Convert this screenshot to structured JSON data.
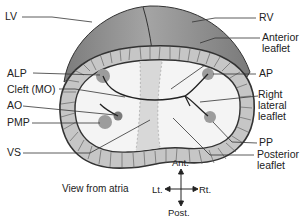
{
  "figure": {
    "caption": "View from atria",
    "labels_left": [
      {
        "id": "lv",
        "text": "LV"
      },
      {
        "id": "alp",
        "text": "ALP"
      },
      {
        "id": "cleft",
        "text": "Cleft (MO)"
      },
      {
        "id": "ao",
        "text": "AO"
      },
      {
        "id": "pmp",
        "text": "PMP"
      },
      {
        "id": "vs",
        "text": "VS"
      }
    ],
    "labels_right": [
      {
        "id": "rv",
        "text": "RV"
      },
      {
        "id": "anterior_leaflet",
        "line1": "Anterior",
        "line2": "leaflet"
      },
      {
        "id": "ap",
        "text": "AP"
      },
      {
        "id": "right_lateral_leaflet",
        "line1": "Right",
        "line2": "lateral",
        "line3": "leaflet"
      },
      {
        "id": "pp",
        "text": "PP"
      },
      {
        "id": "posterior_leaflet",
        "line1": "Posterior",
        "line2": "leaflet"
      }
    ],
    "compass": {
      "up": "Ant.",
      "down": "Post.",
      "left": "Lt.",
      "right": "Rt."
    },
    "colors": {
      "ventricle_cap": "#8a8a8a",
      "muscle_ring": "#c4c4c4",
      "outline": "#333333",
      "valve_interior": "#f3f3f3",
      "septum_band": "#d6d6d6",
      "papillary": "#9a9a9a"
    }
  }
}
